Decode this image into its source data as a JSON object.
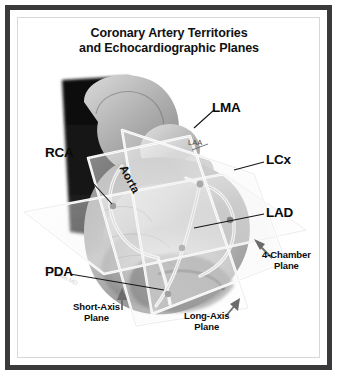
{
  "figure": {
    "title_line1": "Coronary Artery Territories",
    "title_line2": "and Echocardiographic Planes",
    "signature": "M. Brown MD"
  },
  "anatomy": {
    "aorta_label": "Aorta",
    "laa_label": "LAA"
  },
  "artery_labels": [
    {
      "id": "lma",
      "text": "LMA"
    },
    {
      "id": "lcx",
      "text": "LCx"
    },
    {
      "id": "lad",
      "text": "LAD"
    },
    {
      "id": "rca",
      "text": "RCA"
    },
    {
      "id": "pda",
      "text": "PDA"
    }
  ],
  "plane_labels": [
    {
      "id": "four-chamber",
      "line1": "4-Chamber",
      "line2": "Plane"
    },
    {
      "id": "short-axis",
      "line1": "Short-Axis",
      "line2": "Plane"
    },
    {
      "id": "long-axis",
      "line1": "Long-Axis",
      "line2": "Plane"
    }
  ],
  "colors": {
    "frame": "#3a3a3c",
    "inner_border": "#d8d8d8",
    "text": "#0b0b0b",
    "background": "#ffffff",
    "plane_edge": "#ffffff",
    "vessel": "#e9e9e9"
  }
}
